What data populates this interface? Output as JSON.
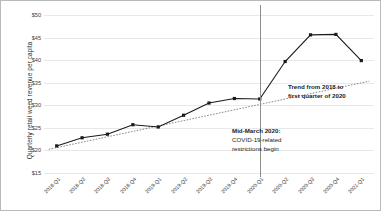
{
  "chart_data": {
    "type": "line",
    "title": "",
    "xlabel": "",
    "ylabel": "Quarterly retail weed revenue per capita",
    "ylim": [
      15,
      50
    ],
    "ytick_values": [
      15,
      20,
      25,
      30,
      35,
      40,
      45,
      50
    ],
    "ytick_labels": [
      "$15",
      "$20",
      "$25",
      "$30",
      "$35",
      "$40",
      "$45",
      "$50"
    ],
    "grid": true,
    "legend": "none",
    "categories": [
      "2018-Q1",
      "2018-Q2",
      "2018-Q3",
      "2018-Q4",
      "2019-Q1",
      "2019-Q2",
      "2019-Q3",
      "2019-Q4",
      "2020-Q1",
      "2020-Q2",
      "2020-Q3",
      "2020-Q4",
      "2021-Q1"
    ],
    "series": [
      {
        "name": "Quarterly retail weed revenue per capita",
        "marker": "square",
        "values": [
          21.0,
          22.8,
          23.6,
          25.7,
          25.2,
          27.8,
          30.5,
          31.5,
          31.4,
          39.7,
          45.6,
          45.7,
          39.9
        ]
      },
      {
        "name": "Trend from 2018 to first quarter of 2020",
        "style": "dotted",
        "values": [
          20.6,
          21.8,
          23.0,
          24.2,
          25.4,
          26.6,
          27.8,
          29.0,
          30.2,
          31.4,
          32.6,
          33.8,
          35.0
        ]
      }
    ],
    "annotations": [
      {
        "name": "trend-annotation",
        "line1": "Trend from 2018 to",
        "line2": "first quarter of 2020"
      },
      {
        "name": "covid-annotation",
        "heading": "Mid-March 2020:",
        "line1": "COVID-19-related",
        "line2": "restrictions begin"
      }
    ],
    "vertical_marker": {
      "name": "mid-march-2020-line",
      "at_category": "2020-Q1"
    },
    "colors": {
      "series_line": "#1a1a1a",
      "trend_line": "#6b6b6b",
      "gridline": "#e8e8e8",
      "axis_text": "#3a3a3a",
      "border": "#b9b9b9"
    }
  }
}
